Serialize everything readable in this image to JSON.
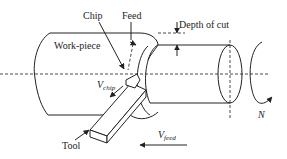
{
  "diagram": {
    "labels": {
      "chip": "Chip",
      "feed": "Feed",
      "depth_of_cut": "Depth of cut",
      "workpiece": "Work-piece",
      "v_chip_main": "V",
      "v_chip_sub": "chip",
      "tool": "Tool",
      "v_feed_main": "V",
      "v_feed_sub": "feed",
      "rotation": "N"
    },
    "colors": {
      "line": "#222222",
      "background": "#ffffff"
    }
  }
}
